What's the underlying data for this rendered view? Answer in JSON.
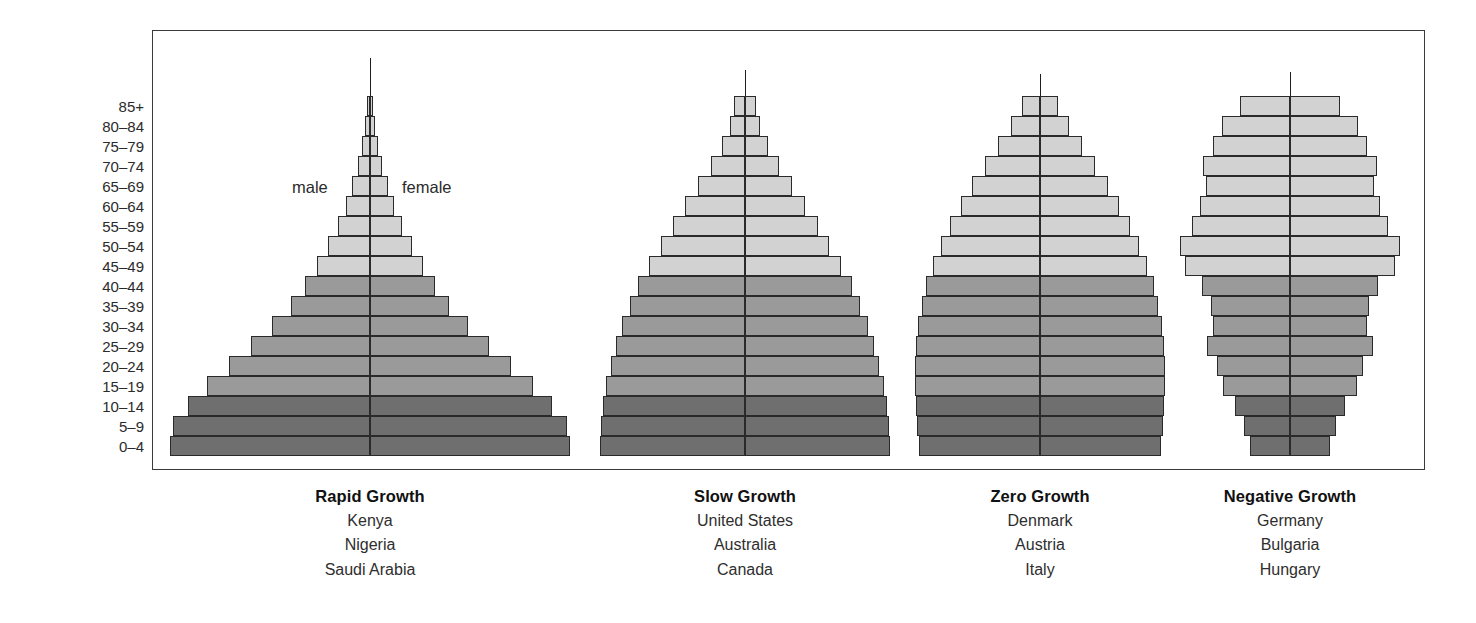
{
  "figure": {
    "axis_title": "age group",
    "male_label": "male",
    "female_label": "female"
  },
  "colors": {
    "band_light": "#d2d2d2",
    "band_medium": "#9a9a9a",
    "band_dark": "#6f6f6f",
    "outline": "#2a2a2a",
    "frame": "#3b3b3b",
    "axis": "#1e1e1e",
    "text": "#222222",
    "background": "#ffffff"
  },
  "chart_data": {
    "type": "bar",
    "subtype": "population-pyramid",
    "title": "",
    "xlabel": "",
    "ylabel": "age group",
    "grid": false,
    "legend_position": "inline-top-center",
    "legend": [
      "male",
      "female"
    ],
    "categories": [
      "85+",
      "80–84",
      "75–79",
      "70–74",
      "65–69",
      "60–64",
      "55–59",
      "50–54",
      "45–49",
      "40–44",
      "35–39",
      "30–34",
      "25–29",
      "20–24",
      "15–19",
      "10–14",
      "5–9",
      "0–4"
    ],
    "shade_bands": [
      {
        "name": "older",
        "applies_to": [
          "85+",
          "80–84",
          "75–79",
          "70–74",
          "65–69",
          "60–64",
          "55–59",
          "50–54",
          "45–49"
        ],
        "color": "#d2d2d2"
      },
      {
        "name": "middle",
        "applies_to": [
          "40–44",
          "35–39",
          "30–34",
          "25–29",
          "20–24",
          "15–19"
        ],
        "color": "#9a9a9a"
      },
      {
        "name": "younger",
        "applies_to": [
          "10–14",
          "5–9",
          "0–4"
        ],
        "color": "#6f6f6f"
      }
    ],
    "panels": [
      {
        "id": "rapid-growth",
        "title": "Rapid Growth",
        "countries": [
          "Kenya",
          "Nigeria",
          "Saudi Arabia"
        ],
        "series": [
          {
            "name": "male",
            "values": [
              3,
              5,
              7,
              11,
              16,
              22,
              29,
              38,
              48,
              59,
              72,
              89,
              108,
              128,
              148,
              166,
              179,
              182
            ]
          },
          {
            "name": "female",
            "values": [
              3,
              5,
              7,
              11,
              16,
              22,
              29,
              38,
              48,
              59,
              72,
              89,
              108,
              128,
              148,
              166,
              179,
              182
            ]
          }
        ]
      },
      {
        "id": "slow-growth",
        "title": "Slow Growth",
        "countries": [
          "United States",
          "Australia",
          "Canada"
        ],
        "series": [
          {
            "name": "male",
            "values": [
              10,
              14,
              22,
              32,
              44,
              56,
              68,
              79,
              90,
              100,
              108,
              115,
              121,
              126,
              130,
              133,
              135,
              136
            ]
          },
          {
            "name": "female",
            "values": [
              10,
              14,
              22,
              32,
              44,
              56,
              68,
              79,
              90,
              100,
              108,
              115,
              121,
              126,
              130,
              133,
              135,
              136
            ]
          }
        ]
      },
      {
        "id": "zero-growth",
        "title": "Zero Growth",
        "countries": [
          "Denmark",
          "Austria",
          "Italy"
        ],
        "series": [
          {
            "name": "male",
            "values": [
              16,
              26,
              38,
              50,
              62,
              72,
              82,
              90,
              98,
              104,
              108,
              111,
              113,
              114,
              114,
              113,
              112,
              110
            ]
          },
          {
            "name": "female",
            "values": [
              16,
              26,
              38,
              50,
              62,
              72,
              82,
              90,
              98,
              104,
              108,
              111,
              113,
              114,
              114,
              113,
              112,
              110
            ]
          }
        ]
      },
      {
        "id": "negative-growth",
        "title": "Negative Growth",
        "countries": [
          "Germany",
          "Bulgaria",
          "Hungary"
        ],
        "series": [
          {
            "name": "male",
            "values": [
              41,
              56,
              63,
              71,
              69,
              74,
              80,
              90,
              86,
              72,
              65,
              63,
              68,
              60,
              55,
              45,
              38,
              33
            ]
          },
          {
            "name": "female",
            "values": [
              41,
              56,
              63,
              71,
              69,
              74,
              80,
              90,
              86,
              72,
              65,
              63,
              68,
              60,
              55,
              45,
              38,
              33
            ]
          }
        ]
      }
    ]
  },
  "panel_geometry": [
    {
      "id": "rapid-growth",
      "left": 170,
      "width": 400,
      "center": 370,
      "scale": 1.0,
      "spire_height": 38
    },
    {
      "id": "slow-growth",
      "left": 600,
      "width": 290,
      "center": 745,
      "scale": 1.0,
      "spire_height": 26
    },
    {
      "id": "zero-growth",
      "left": 930,
      "width": 250,
      "center": 1040,
      "scale": 1.0,
      "spire_height": 22
    },
    {
      "id": "negative-growth",
      "left": 1185,
      "width": 220,
      "center": 1290,
      "scale": 1.0,
      "spire_height": 24
    }
  ]
}
